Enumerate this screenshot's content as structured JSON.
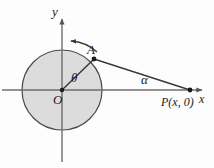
{
  "figure": {
    "background_color": "#fdfdfd",
    "stroke_color": "#3a3a3a",
    "circle_fill_color": "#dcdcdc",
    "axis_color": "#6e6e6e",
    "labels": {
      "y_axis": "y",
      "x_axis": "x",
      "origin": "O",
      "point_a": "A",
      "angle_theta": "θ",
      "angle_alpha": "α",
      "point_p": "P(x, 0)"
    },
    "geometry": {
      "origin": {
        "x": 62,
        "y": 90
      },
      "circle_radius": 40,
      "point_a": {
        "x": 94,
        "y": 59
      },
      "point_p": {
        "x": 190,
        "y": 90
      },
      "x_axis": {
        "x1": 2,
        "y1": 90,
        "x2": 205,
        "y2": 90
      },
      "y_axis": {
        "x1": 62,
        "y1": 160,
        "x2": 62,
        "y2": 16
      },
      "rotation_arrow": "counterclockwise"
    }
  }
}
